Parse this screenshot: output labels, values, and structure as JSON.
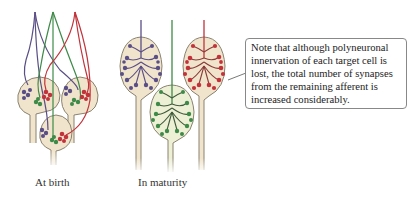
{
  "panels": [
    {
      "id": "at-birth",
      "label": "At birth"
    },
    {
      "id": "in-maturity",
      "label": "In maturity"
    }
  ],
  "note": {
    "text": "Note that although polyneuronal innervation of each target cell is lost, the total number of synapses from the remaining afferent is increased considerably."
  },
  "colors": {
    "purple_axon": "#5a4e86",
    "green_axon": "#3e8a48",
    "red_axon": "#c2323a",
    "cell_fill": "#f1e4cc",
    "cell_stroke": "#8a8270"
  }
}
